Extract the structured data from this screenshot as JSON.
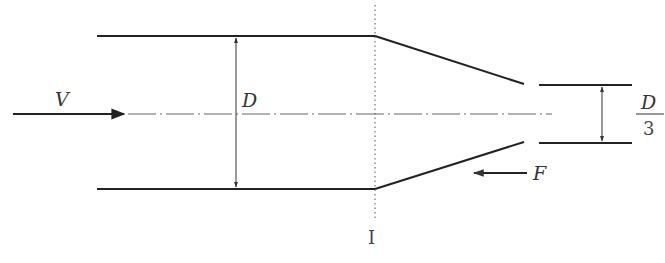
{
  "diagram": {
    "type": "nozzle flow schematic",
    "labels": {
      "velocity": "V",
      "pipe_diameter": "D",
      "jet_diameter_num": "D",
      "jet_diameter_den": "3",
      "force": "F",
      "section": "I"
    },
    "colors": {
      "line": "#222222",
      "thin_line": "#555555",
      "text": "#333333"
    }
  }
}
